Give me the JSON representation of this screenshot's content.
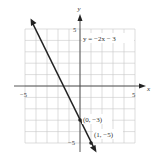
{
  "chart_data": {
    "type": "line",
    "title": "",
    "equation_label": "y = −2x − 3",
    "xlabel": "x",
    "ylabel": "y",
    "xlim": [
      -5,
      5
    ],
    "ylim": [
      -5,
      5
    ],
    "x_tick_labels": [
      "−5",
      "5"
    ],
    "y_tick_labels": [
      "5",
      "−5"
    ],
    "grid": true,
    "grid_step": 1,
    "series": [
      {
        "name": "y = -2x - 3",
        "slope": -2,
        "intercept": -3,
        "x": [
          -4.5,
          1.4
        ],
        "y": [
          6,
          -5.8
        ]
      }
    ],
    "points": [
      {
        "x": 0,
        "y": -3,
        "label": "(0, −3)"
      },
      {
        "x": 1,
        "y": -5,
        "label": "(1, −5)"
      }
    ]
  }
}
